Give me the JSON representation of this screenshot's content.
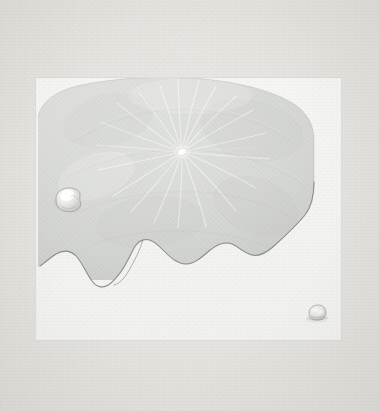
{
  "artwork": {
    "title": "Lotus Leaf with Water Droplets",
    "medium_appearance": "pale monochrome print on paper",
    "canvas": {
      "width": 379,
      "height": 411
    },
    "palette": {
      "mount_background": "#e6e5e2",
      "mount_background_light": "#eceae7",
      "panel_paper": "#f5f5f4",
      "leaf_fill_light": "#dededc",
      "leaf_fill_mid": "#d4d6d3",
      "leaf_fill_dark": "#c8cac7",
      "leaf_outline": "#8d8f8c",
      "vein_highlight": "#eeefed",
      "droplet_outline": "#9a9b97",
      "droplet_highlight": "#fafaf8"
    }
  },
  "panel": {
    "name": "print-panel",
    "x": 36,
    "y": 78,
    "width": 305,
    "height": 262
  },
  "leaf": {
    "name": "lotus-leaf",
    "description": "Round peltate lotus leaf seen from above, upper portion filling the panel, lower margin scalloped and wavy",
    "center_umbilicus": {
      "x": 182,
      "y": 152,
      "rx": 4.5,
      "ry": 3.4
    },
    "vein_count": 20,
    "top_arc_peak": {
      "x": 186,
      "y": 84
    },
    "left_edge_x": 38,
    "right_edge_x": 314
  },
  "droplets": [
    {
      "name": "water-droplet-left",
      "x": 66,
      "y": 200,
      "rx": 11,
      "ry": 8,
      "label": "large water droplet on leaf surface"
    },
    {
      "name": "water-droplet-bottom-right",
      "x": 317,
      "y": 315,
      "rx": 8,
      "ry": 6.5,
      "label": "small water droplet cluster on paper"
    }
  ],
  "fold": {
    "name": "leaf-fold-crease",
    "label": "folded lobe crease on lower-left margin"
  }
}
